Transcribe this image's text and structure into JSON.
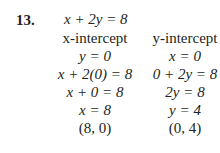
{
  "problem": {
    "number": "13.",
    "equation": "x + 2y = 8"
  },
  "left": {
    "heading": "x-intercept",
    "steps": [
      "y = 0",
      "x + 2(0) = 8",
      "x + 0 = 8",
      "x = 8",
      "(8, 0)"
    ]
  },
  "right": {
    "heading": "y-intercept",
    "steps": [
      "x = 0",
      "0 + 2y = 8",
      "2y = 8",
      "y = 4",
      "(0, 4)"
    ]
  }
}
